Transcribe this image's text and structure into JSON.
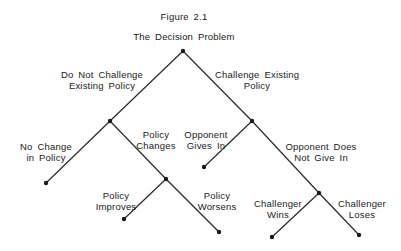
{
  "figure": {
    "number": "Figure 2.1",
    "title": "The Decision Problem"
  },
  "colors": {
    "line": "#2a2a2a",
    "node": "#1a1a1a",
    "background": "#ffffff"
  },
  "nodes": [
    {
      "id": "root",
      "x": 183,
      "y": 51
    },
    {
      "id": "do-not-challenge",
      "x": 110,
      "y": 121
    },
    {
      "id": "challenge",
      "x": 252,
      "y": 121
    },
    {
      "id": "no-change",
      "x": 46,
      "y": 183
    },
    {
      "id": "policy-changes",
      "x": 166,
      "y": 179
    },
    {
      "id": "opponent-gives-in",
      "x": 204,
      "y": 167
    },
    {
      "id": "opponent-not-give-in",
      "x": 319,
      "y": 193
    },
    {
      "id": "policy-improves",
      "x": 124,
      "y": 219
    },
    {
      "id": "policy-worsens",
      "x": 219,
      "y": 232
    },
    {
      "id": "challenger-wins",
      "x": 272,
      "y": 237
    },
    {
      "id": "challenger-loses",
      "x": 359,
      "y": 235
    }
  ],
  "branches": {
    "do_not_challenge": [
      "Do Not Challenge",
      "Existing Policy"
    ],
    "challenge": [
      "Challenge Existing",
      "Policy"
    ],
    "no_change": [
      "No Change",
      "in Policy"
    ],
    "policy_changes": [
      "Policy",
      "Changes"
    ],
    "opponent_gives_in": [
      "Opponent",
      "Gives In"
    ],
    "opponent_not_give_in": [
      "Opponent Does",
      "Not Give In"
    ],
    "policy_improves": [
      "Policy",
      "Improves"
    ],
    "policy_worsens": [
      "Policy",
      "Worsens"
    ],
    "challenger_wins": [
      "Challenger",
      "Wins"
    ],
    "challenger_loses": [
      "Challenger",
      "Loses"
    ]
  }
}
